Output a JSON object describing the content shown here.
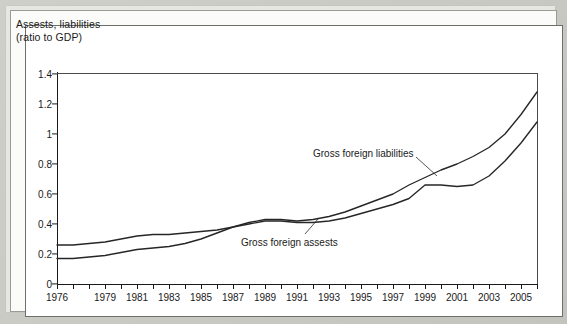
{
  "figure": {
    "title_line1": "Assests, liabilities",
    "title_line2": "(ratio to GDP)",
    "background_color": "#c9c9c4",
    "panel_color": "#ffffff",
    "line_color": "#262626"
  },
  "chart_data": {
    "type": "line",
    "title": "Assests, liabilities (ratio to GDP)",
    "xlabel": "",
    "ylabel": "Assests, liabilities (ratio to GDP)",
    "xlim": [
      1976,
      2006
    ],
    "ylim": [
      0,
      1.4
    ],
    "grid": false,
    "legend_position": "inline-annotations",
    "ytick_labels": [
      "0",
      "0.2",
      "0.4",
      "0.6",
      "0.8",
      "1",
      "1.2",
      "1.4"
    ],
    "ytick_values": [
      0,
      0.2,
      0.4,
      0.6,
      0.8,
      1,
      1.2,
      1.4
    ],
    "xtick_labels": [
      "1976",
      "1979",
      "1981",
      "1983",
      "1985",
      "1987",
      "1989",
      "1991",
      "1993",
      "1995",
      "1997",
      "1999",
      "2001",
      "2003",
      "2005"
    ],
    "xtick_values": [
      1976,
      1979,
      1981,
      1983,
      1985,
      1987,
      1989,
      1991,
      1993,
      1995,
      1997,
      1999,
      2001,
      2003,
      2005
    ],
    "x": [
      1976,
      1977,
      1978,
      1979,
      1980,
      1981,
      1982,
      1983,
      1984,
      1985,
      1986,
      1987,
      1988,
      1989,
      1990,
      1991,
      1992,
      1993,
      1994,
      1995,
      1996,
      1997,
      1998,
      1999,
      2000,
      2001,
      2002,
      2003,
      2004,
      2005,
      2006
    ],
    "series": [
      {
        "name": "Gross foreign liabilities",
        "values": [
          0.26,
          0.26,
          0.27,
          0.28,
          0.3,
          0.32,
          0.33,
          0.33,
          0.34,
          0.35,
          0.36,
          0.38,
          0.41,
          0.43,
          0.43,
          0.42,
          0.43,
          0.45,
          0.48,
          0.52,
          0.56,
          0.6,
          0.66,
          0.71,
          0.76,
          0.8,
          0.85,
          0.91,
          1.0,
          1.13,
          1.28
        ]
      },
      {
        "name": "Gross foreign assests",
        "values": [
          0.17,
          0.17,
          0.18,
          0.19,
          0.21,
          0.23,
          0.24,
          0.25,
          0.27,
          0.3,
          0.34,
          0.38,
          0.4,
          0.42,
          0.42,
          0.41,
          0.41,
          0.42,
          0.44,
          0.47,
          0.5,
          0.53,
          0.57,
          0.66,
          0.66,
          0.65,
          0.66,
          0.72,
          0.82,
          0.94,
          1.08
        ]
      }
    ],
    "annotations": [
      {
        "text": "Gross foreign liabilities",
        "label_x_px": 313,
        "label_y_px": 148,
        "leader_from": [
          416,
          157
        ],
        "leader_to": [
          437,
          176
        ]
      },
      {
        "text": "Gross foreign assests",
        "label_x_px": 241,
        "label_y_px": 237,
        "leader_from": [
          305,
          234
        ],
        "leader_to": [
          318,
          219
        ]
      }
    ]
  }
}
